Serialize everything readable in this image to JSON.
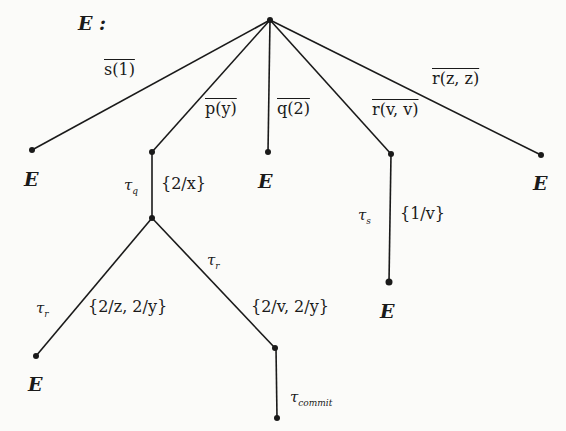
{
  "title": "E :",
  "tree": {
    "root": {
      "x": 270,
      "y": 20
    },
    "nodes": [
      {
        "id": "root",
        "x": 270,
        "y": 20
      },
      {
        "id": "s-leaf",
        "x": 32,
        "y": 150,
        "label": "E"
      },
      {
        "id": "p-node",
        "x": 152,
        "y": 152
      },
      {
        "id": "q-leaf",
        "x": 268,
        "y": 152,
        "label": "E"
      },
      {
        "id": "rv-node",
        "x": 391,
        "y": 154
      },
      {
        "id": "rz-leaf",
        "x": 541,
        "y": 155,
        "label": "E"
      },
      {
        "id": "tq-node",
        "x": 152,
        "y": 218
      },
      {
        "id": "ts-leaf",
        "x": 389,
        "y": 282,
        "label": "E"
      },
      {
        "id": "tr-left-leaf",
        "x": 36,
        "y": 356,
        "label": "E"
      },
      {
        "id": "tr-right-node",
        "x": 275,
        "y": 348
      },
      {
        "id": "commit-leaf",
        "x": 277,
        "y": 418
      }
    ],
    "edges": [
      {
        "from": "root",
        "to": "s-leaf",
        "action": "s̄(1)"
      },
      {
        "from": "root",
        "to": "p-node",
        "action": "p̄(y)"
      },
      {
        "from": "root",
        "to": "q-leaf",
        "action": "q̄(2)"
      },
      {
        "from": "root",
        "to": "rv-node",
        "action": "r̄(v, v)"
      },
      {
        "from": "root",
        "to": "rz-leaf",
        "action": "r̄(z, z)"
      },
      {
        "from": "p-node",
        "to": "tq-node",
        "action": "τq",
        "substitution": "{2/x}"
      },
      {
        "from": "rv-node",
        "to": "ts-leaf",
        "action": "τs",
        "substitution": "{1/v}"
      },
      {
        "from": "tq-node",
        "to": "tr-left-leaf",
        "action": "τr",
        "substitution": "{2/z, 2/y}"
      },
      {
        "from": "tq-node",
        "to": "tr-right-node",
        "action": "τr",
        "substitution": "{2/v, 2/y}"
      },
      {
        "from": "tr-right-node",
        "to": "commit-leaf",
        "action": "τcommit"
      }
    ]
  },
  "labels": {
    "s_bar": "s(1)",
    "p_bar": "p(y)",
    "q_bar": "q(2)",
    "r_vv": "r(v, v)",
    "r_zz": "r(z, z)",
    "tau": "τ",
    "sub_q": "q",
    "sub_s": "s",
    "sub_r": "r",
    "sub_commit": "commit",
    "subst_x": "{2/x}",
    "subst_v1": "{1/v}",
    "subst_zy": "{2/z, 2/y}",
    "subst_vy": "{2/v, 2/y}",
    "leaf": "E"
  }
}
